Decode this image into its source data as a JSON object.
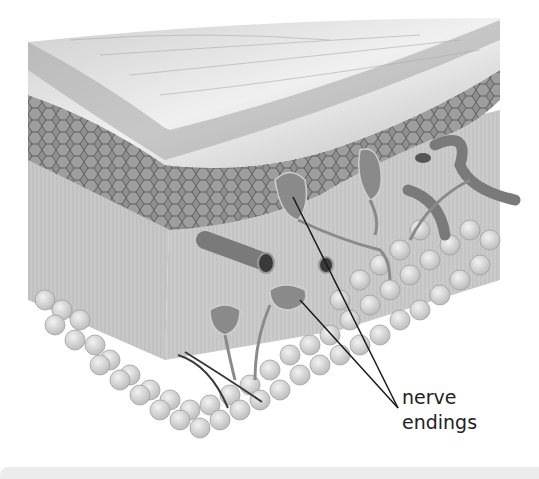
{
  "diagram": {
    "label_line1": "nerve",
    "label_line2": "endings",
    "colors": {
      "surface": "#d9d9d9",
      "epidermis": "#8a8a8a",
      "cells": "#6e6e6e",
      "dermis": "#c4c4c4",
      "fat": "#dcdcdc",
      "vessel": "#7a7a7a",
      "leader": "#1a1a1a",
      "text": "#222222"
    }
  }
}
